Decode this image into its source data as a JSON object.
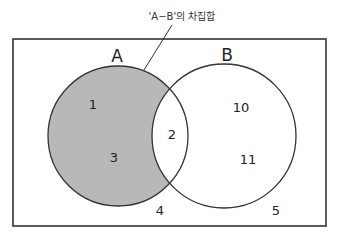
{
  "diagram": {
    "caption": "'A−B'의 차집합",
    "sets": [
      {
        "name": "A",
        "label": "A",
        "shaded_region": "A-B"
      },
      {
        "name": "B",
        "label": "B"
      }
    ],
    "elements": {
      "a_only": [
        "1",
        "3"
      ],
      "intersection": [
        "2"
      ],
      "b_only": [
        "10",
        "11"
      ],
      "outside": [
        "4",
        "5"
      ]
    },
    "colors": {
      "shade": "#b8b8b8",
      "stroke": "#333333",
      "background": "#ffffff"
    }
  }
}
